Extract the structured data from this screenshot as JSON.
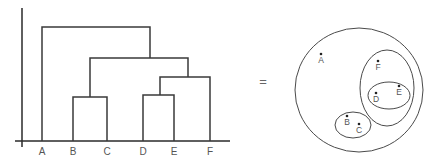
{
  "dendrogram": {
    "leaves": [
      {
        "label": "A",
        "x": 42
      },
      {
        "label": "B",
        "x": 73
      },
      {
        "label": "C",
        "x": 107
      },
      {
        "label": "D",
        "x": 143
      },
      {
        "label": "E",
        "x": 174
      },
      {
        "label": "F",
        "x": 210
      }
    ],
    "merges": [
      {
        "members": [
          "B",
          "C"
        ],
        "height": 97
      },
      {
        "members": [
          "D",
          "E"
        ],
        "height": 95
      },
      {
        "members": [
          "D",
          "E",
          "F"
        ],
        "height": 77
      },
      {
        "members": [
          "B",
          "C",
          "D",
          "E",
          "F"
        ],
        "height": 58
      },
      {
        "members": [
          "A",
          "B",
          "C",
          "D",
          "E",
          "F"
        ],
        "height": 27
      }
    ]
  },
  "equals_sign": "=",
  "venn": {
    "points": [
      {
        "label": "A",
        "x": 321,
        "y": 54
      },
      {
        "label": "B",
        "x": 347,
        "y": 116
      },
      {
        "label": "C",
        "x": 359,
        "y": 124
      },
      {
        "label": "D",
        "x": 376,
        "y": 93
      },
      {
        "label": "E",
        "x": 399,
        "y": 86
      },
      {
        "label": "F",
        "x": 378,
        "y": 61
      }
    ],
    "sets": [
      {
        "name": "ABCDEF",
        "cx": 359,
        "cy": 90,
        "rx": 64,
        "ry": 62
      },
      {
        "name": "DEF",
        "cx": 387,
        "cy": 88,
        "rx": 27,
        "ry": 38
      },
      {
        "name": "DE",
        "cx": 389,
        "cy": 95.5,
        "rx": 21,
        "ry": 13.5
      },
      {
        "name": "BC",
        "cx": 353,
        "cy": 125,
        "rx": 18,
        "ry": 13
      }
    ]
  }
}
